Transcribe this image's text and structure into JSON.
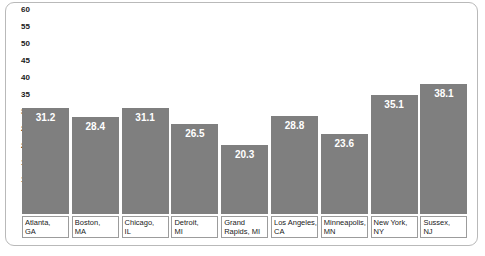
{
  "chart_data": {
    "type": "bar",
    "title": "",
    "subtitle": "",
    "xlabel": "",
    "ylabel": "",
    "categories": [
      "Atlanta, GA",
      "Boston, MA",
      "Chicago, IL",
      "Detroit, MI",
      "Grand Rapids, MI",
      "Los Angeles, CA",
      "Minneapolis, MN",
      "New York, NY",
      "Sussex, NJ"
    ],
    "category_lines": [
      [
        "Atlanta,",
        "GA"
      ],
      [
        "Boston,",
        "MA"
      ],
      [
        "Chicago,",
        "IL"
      ],
      [
        "Detroit,",
        "MI"
      ],
      [
        "Grand",
        "Rapids, MI"
      ],
      [
        "Los Angeles,",
        "CA"
      ],
      [
        "Minneapolis,",
        "MN"
      ],
      [
        "New York,",
        "NY"
      ],
      [
        "Sussex,",
        "NJ"
      ]
    ],
    "values": [
      31.2,
      28.4,
      31.1,
      26.5,
      20.3,
      28.8,
      23.6,
      35.1,
      38.1
    ],
    "value_labels": [
      "31.2",
      "28.4",
      "31.1",
      "26.5",
      "20.3",
      "28.8",
      "23.6",
      "35.1",
      "38.1"
    ],
    "ylim": [
      0,
      60
    ],
    "yticks": [
      60,
      55,
      50,
      45,
      40,
      35,
      30,
      25,
      20,
      15,
      10,
      5
    ],
    "ytick_labels": [
      "60",
      "55",
      "50",
      "45",
      "40",
      "35",
      "30",
      "25",
      "20",
      "15",
      "10",
      "5"
    ],
    "grid": false,
    "legend": false,
    "bar_color": "#7f7f7f",
    "text_color": "#1a1a1a",
    "value_label_color": "#ffffff",
    "frame_color": "#b9b9b9"
  }
}
